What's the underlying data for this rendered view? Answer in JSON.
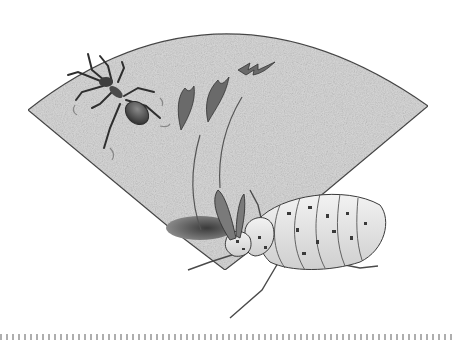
{
  "illustration": {
    "subject": "ant-lion larva in burrow catching an ant",
    "elements": [
      "sand-fan",
      "ant",
      "motion-lines",
      "sand-flicks",
      "burrow-hole",
      "larva"
    ],
    "colors": {
      "background": "#ffffff",
      "sand": "#d8d8d8",
      "outline": "#4a4a4a",
      "ant_body": "#505050",
      "larva_body": "#e4e4e4",
      "larva_spots": "#3a3a3a",
      "hole": "#6a6a6a"
    }
  },
  "divider": {
    "style": "dotted"
  }
}
